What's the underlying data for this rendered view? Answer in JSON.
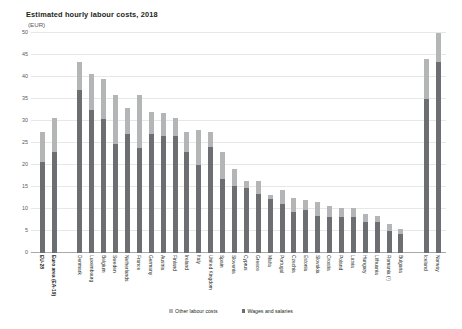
{
  "chart_data": {
    "type": "bar",
    "subtype": "stacked-column",
    "title": "Estimated hourly labour costs, 2018",
    "subtitle": "(EUR)",
    "xlabel": "",
    "ylabel": "",
    "ylim": [
      0,
      50
    ],
    "yticks": [
      0,
      5,
      10,
      15,
      20,
      25,
      30,
      35,
      40,
      45,
      50
    ],
    "grid": true,
    "legend_position": "bottom",
    "legend": [
      "Other labour costs",
      "Wages and salaries"
    ],
    "categories": [
      "EU-28",
      "Euro area (EA-19)",
      "Denmark",
      "Luxembourg",
      "Belgium",
      "Sweden",
      "Netherlands",
      "France",
      "Germany",
      "Austria",
      "Finland",
      "Ireland",
      "Italy",
      "United Kingdom",
      "Spain",
      "Slovenia",
      "Cyprus",
      "Greece",
      "Malta",
      "Portugal",
      "Czechia",
      "Estonia",
      "Slovakia",
      "Croatia",
      "Poland",
      "Latvia",
      "Hungary",
      "Lithuania",
      "Romania (¹)",
      "Bulgaria",
      "Iceland",
      "Norway"
    ],
    "gaps_after": [
      "Euro area (EA-19)",
      "Bulgaria"
    ],
    "series": [
      {
        "name": "Wages and salaries",
        "color": "#6d6e71",
        "values": [
          20.6,
          22.9,
          37.0,
          32.5,
          30.5,
          24.7,
          27.0,
          23.8,
          27.0,
          26.7,
          26.5,
          23.0,
          20.0,
          24.1,
          16.8,
          15.2,
          14.8,
          13.5,
          12.2,
          11.2,
          9.3,
          9.7,
          8.3,
          8.2,
          8.2,
          8.1,
          7.0,
          7.0,
          5.0,
          4.4,
          35.0,
          43.3
        ]
      },
      {
        "name": "Other labour costs",
        "color": "#b4b5b7",
        "values": [
          6.8,
          7.7,
          6.5,
          8.1,
          9.0,
          11.3,
          6.0,
          12.2,
          5.0,
          5.1,
          4.1,
          4.5,
          8.0,
          3.3,
          6.2,
          3.8,
          1.6,
          2.9,
          1.1,
          3.1,
          3.2,
          2.4,
          3.2,
          2.5,
          2.1,
          2.1,
          1.9,
          1.5,
          1.5,
          1.0,
          9.0,
          6.7
        ]
      }
    ],
    "totals": [
      27.4,
      30.6,
      43.5,
      40.6,
      39.5,
      36.0,
      33.0,
      36.0,
      32.0,
      31.8,
      30.6,
      27.5,
      28.0,
      27.4,
      23.0,
      19.0,
      16.4,
      16.4,
      13.3,
      14.3,
      12.5,
      12.1,
      11.5,
      10.7,
      10.3,
      10.2,
      8.9,
      8.5,
      6.5,
      5.4,
      44.0,
      50.0
    ]
  }
}
